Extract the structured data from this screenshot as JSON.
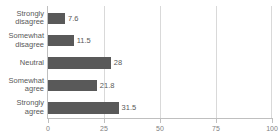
{
  "chart_data": {
    "type": "bar",
    "orientation": "horizontal",
    "title": "",
    "subtitle": "",
    "xlabel": "",
    "ylabel": "",
    "categories": [
      "Strongly disagree",
      "Somewhat disagree",
      "Neutral",
      "Somewhat agree",
      "Strongly agree"
    ],
    "values": [
      7.6,
      11.5,
      28,
      21.8,
      31.5
    ],
    "value_labels": [
      "7.6",
      "11.5",
      "28",
      "21.8",
      "31.5"
    ],
    "xlim": [
      0,
      100
    ],
    "xticks": [
      0,
      25,
      50,
      75,
      100
    ],
    "xtick_labels": [
      "0",
      "25",
      "50",
      "75",
      "100"
    ],
    "grid": "vertical",
    "legend": "none",
    "series": [
      {
        "name": "",
        "values": [
          7.6,
          11.5,
          28,
          21.8,
          31.5
        ]
      }
    ]
  },
  "style": {
    "bar_color": "#595959",
    "gridline_color": "#d9d9d9",
    "axis_color": "#bfbfbf",
    "text_color": "#595959",
    "tick_label_color": "#7f7f7f",
    "background": "#ffffff"
  }
}
